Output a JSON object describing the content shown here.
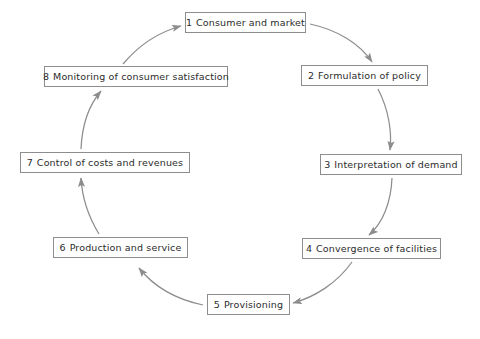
{
  "diagram": {
    "type": "cycle-flow-diagram",
    "direction": "clockwise",
    "stroke_color": "#8d8d8d",
    "text_color": "#2b2b2b",
    "background_color": "#ffffff",
    "nodes": [
      {
        "num": "1",
        "label": "Consumer and market"
      },
      {
        "num": "2",
        "label": "Formulation of policy"
      },
      {
        "num": "3",
        "label": "Interpretation of demand"
      },
      {
        "num": "4",
        "label": "Convergence of facilities"
      },
      {
        "num": "5",
        "label": "Provisioning"
      },
      {
        "num": "6",
        "label": "Production and service"
      },
      {
        "num": "7",
        "label": "Control of costs and revenues"
      },
      {
        "num": "8",
        "label": "Monitoring of consumer satisfaction"
      }
    ],
    "connectors": [
      {
        "from": "1",
        "to": "2"
      },
      {
        "from": "2",
        "to": "3"
      },
      {
        "from": "3",
        "to": "4"
      },
      {
        "from": "4",
        "to": "5"
      },
      {
        "from": "5",
        "to": "6"
      },
      {
        "from": "6",
        "to": "7"
      },
      {
        "from": "7",
        "to": "8"
      },
      {
        "from": "8",
        "to": "1"
      }
    ]
  }
}
